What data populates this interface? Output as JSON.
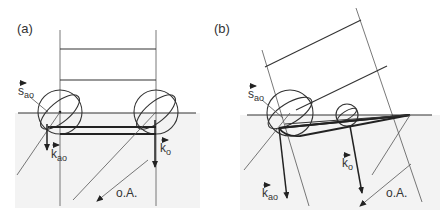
{
  "figure": {
    "panels": [
      {
        "id": "a",
        "label": "(a)",
        "vectors": {
          "s_ao": {
            "symbol": "s",
            "subscript": "ao"
          },
          "k_ao": {
            "symbol": "k",
            "subscript": "ao"
          },
          "k_o": {
            "symbol": "k",
            "subscript": "o"
          }
        },
        "optic_axis_label": "o.A."
      },
      {
        "id": "b",
        "label": "(b)",
        "vectors": {
          "s_ao": {
            "symbol": "s",
            "subscript": "ao"
          },
          "k_ao": {
            "symbol": "k",
            "subscript": "ao"
          },
          "k_o": {
            "symbol": "k",
            "subscript": "o"
          }
        },
        "optic_axis_label": "o.A."
      }
    ],
    "colors": {
      "line": "#333333",
      "shade": "#f2f2f2",
      "background": "#ffffff"
    }
  }
}
